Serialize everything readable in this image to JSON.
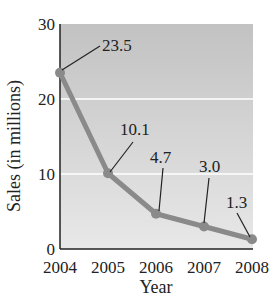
{
  "chart_data": {
    "type": "line",
    "title": "",
    "xlabel": "Year",
    "ylabel": "Sales (in millions)",
    "categories": [
      "2004",
      "2005",
      "2006",
      "2007",
      "2008"
    ],
    "series": [
      {
        "name": "Sales",
        "values": [
          23.5,
          10.1,
          4.7,
          3.0,
          1.3
        ]
      }
    ],
    "data_labels": [
      "23.5",
      "10.1",
      "4.7",
      "3.0",
      "1.3"
    ],
    "ylim": [
      0,
      30
    ],
    "yticks": [
      "0",
      "10",
      "20",
      "30"
    ],
    "grid": true,
    "legend": null
  },
  "style": {
    "plot_bg_top": "#c4c4c4",
    "plot_bg_bottom": "#e6e6e6",
    "line_color": "#8a8a8a",
    "gridline_color": "#ffffff",
    "axis_color": "#222222"
  }
}
